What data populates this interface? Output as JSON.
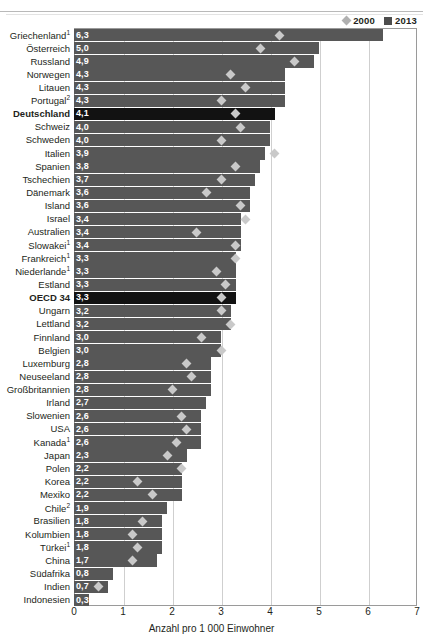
{
  "legend": {
    "items": [
      {
        "label": "2000",
        "icon": "diamond-marker",
        "color": "#b0b0b0"
      },
      {
        "label": "2013",
        "icon": "square-marker",
        "color": "#4d4d4d"
      }
    ]
  },
  "axis": {
    "title": "Anzahl pro 1 000 Einwohner",
    "ticks": [
      "0",
      "1",
      "2",
      "3",
      "4",
      "5",
      "6",
      "7"
    ]
  },
  "chart_data": {
    "type": "bar",
    "orientation": "horizontal",
    "title": "",
    "xlabel": "Anzahl pro 1 000 Einwohner",
    "ylabel": "",
    "xlim": [
      0,
      7
    ],
    "grid": true,
    "legend_position": "top-right",
    "series": [
      {
        "name": "2013",
        "type": "bar",
        "color": "#575757"
      },
      {
        "name": "2000",
        "type": "marker",
        "color": "#c9c9c9"
      }
    ],
    "categories": [
      "Griechenland¹",
      "Österreich",
      "Russland",
      "Norwegen",
      "Litauen",
      "Portugal²",
      "Deutschland",
      "Schweiz",
      "Schweden",
      "Italien",
      "Spanien",
      "Tschechien",
      "Dänemark",
      "Island",
      "Israel",
      "Australien",
      "Slowakei¹",
      "Frankreich¹",
      "Niederlande¹",
      "Estland",
      "OECD 34",
      "Ungarn",
      "Lettland",
      "Finnland",
      "Belgien",
      "Luxemburg",
      "Neuseeland",
      "Großbritannien",
      "Irland",
      "Slowenien",
      "USA",
      "Kanada¹",
      "Japan",
      "Polen",
      "Korea",
      "Mexiko",
      "Chile²",
      "Brasilien",
      "Kolumbien",
      "Türkei¹",
      "China",
      "Südafrika",
      "Indien",
      "Indonesien"
    ],
    "values_2013": [
      6.3,
      5.0,
      4.9,
      4.3,
      4.3,
      4.3,
      4.1,
      4.0,
      4.0,
      3.9,
      3.8,
      3.7,
      3.6,
      3.6,
      3.4,
      3.4,
      3.4,
      3.3,
      3.3,
      3.3,
      3.3,
      3.2,
      3.2,
      3.0,
      3.0,
      2.8,
      2.8,
      2.8,
      2.7,
      2.6,
      2.6,
      2.6,
      2.3,
      2.2,
      2.2,
      2.2,
      1.9,
      1.8,
      1.8,
      1.8,
      1.7,
      0.8,
      0.7,
      0.3
    ],
    "values_2000": [
      4.2,
      3.8,
      4.5,
      3.2,
      3.5,
      3.0,
      3.3,
      3.4,
      3.0,
      4.1,
      3.3,
      3.0,
      2.7,
      3.4,
      3.5,
      2.5,
      3.3,
      3.3,
      2.9,
      3.1,
      3.0,
      3.0,
      3.2,
      2.6,
      3.0,
      2.3,
      2.4,
      2.0,
      null,
      2.2,
      2.3,
      2.1,
      1.9,
      2.2,
      1.3,
      1.6,
      null,
      1.4,
      1.2,
      1.3,
      1.2,
      null,
      0.5,
      null
    ]
  },
  "rows": [
    {
      "label": "Griechenland",
      "sup": "1",
      "value_text": "6,3",
      "v2013": 6.3,
      "v2000": 4.2,
      "highlight": false
    },
    {
      "label": "Österreich",
      "sup": "",
      "value_text": "5,0",
      "v2013": 5.0,
      "v2000": 3.8,
      "highlight": false
    },
    {
      "label": "Russland",
      "sup": "",
      "value_text": "4,9",
      "v2013": 4.9,
      "v2000": 4.5,
      "highlight": false
    },
    {
      "label": "Norwegen",
      "sup": "",
      "value_text": "4,3",
      "v2013": 4.3,
      "v2000": 3.2,
      "highlight": false
    },
    {
      "label": "Litauen",
      "sup": "",
      "value_text": "4,3",
      "v2013": 4.3,
      "v2000": 3.5,
      "highlight": false
    },
    {
      "label": "Portugal",
      "sup": "2",
      "value_text": "4,3",
      "v2013": 4.3,
      "v2000": 3.0,
      "highlight": false
    },
    {
      "label": "Deutschland",
      "sup": "",
      "value_text": "4,1",
      "v2013": 4.1,
      "v2000": 3.3,
      "highlight": true
    },
    {
      "label": "Schweiz",
      "sup": "",
      "value_text": "4,0",
      "v2013": 4.0,
      "v2000": 3.4,
      "highlight": false
    },
    {
      "label": "Schweden",
      "sup": "",
      "value_text": "4,0",
      "v2013": 4.0,
      "v2000": 3.0,
      "highlight": false
    },
    {
      "label": "Italien",
      "sup": "",
      "value_text": "3,9",
      "v2013": 3.9,
      "v2000": 4.1,
      "highlight": false
    },
    {
      "label": "Spanien",
      "sup": "",
      "value_text": "3,8",
      "v2013": 3.8,
      "v2000": 3.3,
      "highlight": false
    },
    {
      "label": "Tschechien",
      "sup": "",
      "value_text": "3,7",
      "v2013": 3.7,
      "v2000": 3.0,
      "highlight": false
    },
    {
      "label": "Dänemark",
      "sup": "",
      "value_text": "3,6",
      "v2013": 3.6,
      "v2000": 2.7,
      "highlight": false
    },
    {
      "label": "Island",
      "sup": "",
      "value_text": "3,6",
      "v2013": 3.6,
      "v2000": 3.4,
      "highlight": false
    },
    {
      "label": "Israel",
      "sup": "",
      "value_text": "3,4",
      "v2013": 3.4,
      "v2000": 3.5,
      "highlight": false
    },
    {
      "label": "Australien",
      "sup": "",
      "value_text": "3,4",
      "v2013": 3.4,
      "v2000": 2.5,
      "highlight": false
    },
    {
      "label": "Slowakei",
      "sup": "1",
      "value_text": "3,4",
      "v2013": 3.4,
      "v2000": 3.3,
      "highlight": false
    },
    {
      "label": "Frankreich",
      "sup": "1",
      "value_text": "3,3",
      "v2013": 3.3,
      "v2000": 3.3,
      "highlight": false
    },
    {
      "label": "Niederlande",
      "sup": "1",
      "value_text": "3,3",
      "v2013": 3.3,
      "v2000": 2.9,
      "highlight": false
    },
    {
      "label": "Estland",
      "sup": "",
      "value_text": "3,3",
      "v2013": 3.3,
      "v2000": 3.1,
      "highlight": false
    },
    {
      "label": "OECD 34",
      "sup": "",
      "value_text": "3,3",
      "v2013": 3.3,
      "v2000": 3.0,
      "highlight": true
    },
    {
      "label": "Ungarn",
      "sup": "",
      "value_text": "3,2",
      "v2013": 3.2,
      "v2000": 3.0,
      "highlight": false
    },
    {
      "label": "Lettland",
      "sup": "",
      "value_text": "3,2",
      "v2013": 3.2,
      "v2000": 3.2,
      "highlight": false
    },
    {
      "label": "Finnland",
      "sup": "",
      "value_text": "3,0",
      "v2013": 3.0,
      "v2000": 2.6,
      "highlight": false
    },
    {
      "label": "Belgien",
      "sup": "",
      "value_text": "3,0",
      "v2013": 3.0,
      "v2000": 3.0,
      "highlight": false
    },
    {
      "label": "Luxemburg",
      "sup": "",
      "value_text": "2,8",
      "v2013": 2.8,
      "v2000": 2.3,
      "highlight": false
    },
    {
      "label": "Neuseeland",
      "sup": "",
      "value_text": "2,8",
      "v2013": 2.8,
      "v2000": 2.4,
      "highlight": false
    },
    {
      "label": "Großbritannien",
      "sup": "",
      "value_text": "2,8",
      "v2013": 2.8,
      "v2000": 2.0,
      "highlight": false
    },
    {
      "label": "Irland",
      "sup": "",
      "value_text": "2,7",
      "v2013": 2.7,
      "v2000": null,
      "highlight": false
    },
    {
      "label": "Slowenien",
      "sup": "",
      "value_text": "2,6",
      "v2013": 2.6,
      "v2000": 2.2,
      "highlight": false
    },
    {
      "label": "USA",
      "sup": "",
      "value_text": "2,6",
      "v2013": 2.6,
      "v2000": 2.3,
      "highlight": false
    },
    {
      "label": "Kanada",
      "sup": "1",
      "value_text": "2,6",
      "v2013": 2.6,
      "v2000": 2.1,
      "highlight": false
    },
    {
      "label": "Japan",
      "sup": "",
      "value_text": "2,3",
      "v2013": 2.3,
      "v2000": 1.9,
      "highlight": false
    },
    {
      "label": "Polen",
      "sup": "",
      "value_text": "2,2",
      "v2013": 2.2,
      "v2000": 2.2,
      "highlight": false
    },
    {
      "label": "Korea",
      "sup": "",
      "value_text": "2,2",
      "v2013": 2.2,
      "v2000": 1.3,
      "highlight": false
    },
    {
      "label": "Mexiko",
      "sup": "",
      "value_text": "2,2",
      "v2013": 2.2,
      "v2000": 1.6,
      "highlight": false
    },
    {
      "label": "Chile",
      "sup": "2",
      "value_text": "1,9",
      "v2013": 1.9,
      "v2000": null,
      "highlight": false
    },
    {
      "label": "Brasilien",
      "sup": "",
      "value_text": "1,8",
      "v2013": 1.8,
      "v2000": 1.4,
      "highlight": false
    },
    {
      "label": "Kolumbien",
      "sup": "",
      "value_text": "1,8",
      "v2013": 1.8,
      "v2000": 1.2,
      "highlight": false
    },
    {
      "label": "Türkei",
      "sup": "1",
      "value_text": "1,8",
      "v2013": 1.8,
      "v2000": 1.3,
      "highlight": false
    },
    {
      "label": "China",
      "sup": "",
      "value_text": "1,7",
      "v2013": 1.7,
      "v2000": 1.2,
      "highlight": false
    },
    {
      "label": "Südafrika",
      "sup": "",
      "value_text": "0,8",
      "v2013": 0.8,
      "v2000": null,
      "highlight": false
    },
    {
      "label": "Indien",
      "sup": "",
      "value_text": "0,7",
      "v2013": 0.7,
      "v2000": 0.5,
      "highlight": false
    },
    {
      "label": "Indonesien",
      "sup": "",
      "value_text": "0,3",
      "v2013": 0.3,
      "v2000": null,
      "highlight": false
    }
  ]
}
